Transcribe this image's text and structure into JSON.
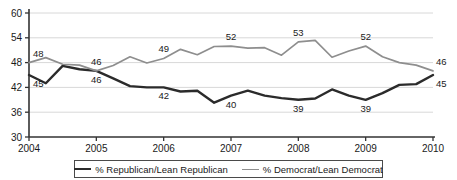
{
  "chart_data": {
    "type": "line",
    "title": "",
    "xlabel": "",
    "ylabel": "",
    "ylim": [
      30,
      60
    ],
    "xlim": [
      2004,
      2010
    ],
    "yticks": [
      30,
      36,
      42,
      48,
      54,
      60
    ],
    "xticks": [
      2004,
      2005,
      2006,
      2007,
      2008,
      2009,
      2010
    ],
    "ytick_labels": [
      "30",
      "36",
      "42",
      "48",
      "54",
      "60"
    ],
    "xtick_labels": [
      "2004",
      "2005",
      "2006",
      "2007",
      "2008",
      "2009",
      "2010"
    ],
    "grid": true,
    "legend_position": "bottom",
    "x": [
      2004.0,
      2004.25,
      2004.5,
      2004.75,
      2005.0,
      2005.25,
      2005.5,
      2005.75,
      2006.0,
      2006.25,
      2006.5,
      2006.75,
      2007.0,
      2007.25,
      2007.5,
      2007.75,
      2008.0,
      2008.25,
      2008.5,
      2008.75,
      2009.0,
      2009.25,
      2009.5,
      2009.75,
      2010.0
    ],
    "series": [
      {
        "name": "% Republican/Lean Republican",
        "color": "#2b2b2b",
        "values": [
          45.0,
          43.0,
          47.2,
          46.4,
          46.0,
          44.2,
          42.3,
          42.0,
          42.0,
          41.0,
          41.2,
          38.3,
          40.0,
          41.2,
          40.0,
          39.4,
          39.0,
          39.3,
          41.5,
          40.0,
          39.0,
          40.6,
          42.6,
          42.8,
          45.0
        ],
        "labels": [
          {
            "x": 2004.0,
            "value": 45,
            "text": "45"
          },
          {
            "x": 2005.0,
            "value": 46,
            "text": "46"
          },
          {
            "x": 2006.0,
            "value": 42,
            "text": "42"
          },
          {
            "x": 2007.0,
            "value": 40,
            "text": "40"
          },
          {
            "x": 2008.0,
            "value": 39,
            "text": "39"
          },
          {
            "x": 2009.0,
            "value": 39,
            "text": "39"
          },
          {
            "x": 2010.0,
            "value": 45,
            "text": "45"
          }
        ]
      },
      {
        "name": "% Democrat/Lean Democrat",
        "color": "#8e8e8e",
        "values": [
          48.0,
          49.2,
          47.6,
          47.4,
          46.0,
          47.3,
          49.4,
          47.9,
          49.0,
          51.2,
          49.9,
          51.9,
          52.0,
          51.5,
          51.6,
          49.8,
          53.0,
          53.4,
          49.3,
          50.8,
          52.0,
          49.4,
          48.0,
          47.4,
          46.0
        ],
        "labels": [
          {
            "x": 2004.0,
            "value": 48,
            "text": "48"
          },
          {
            "x": 2005.0,
            "value": 46,
            "text": "46"
          },
          {
            "x": 2006.0,
            "value": 49,
            "text": "49"
          },
          {
            "x": 2007.0,
            "value": 52,
            "text": "52"
          },
          {
            "x": 2008.0,
            "value": 53,
            "text": "53"
          },
          {
            "x": 2009.0,
            "value": 52,
            "text": "52"
          },
          {
            "x": 2010.0,
            "value": 46,
            "text": "46"
          }
        ]
      }
    ]
  },
  "legend": {
    "items": [
      {
        "label": "% Republican/Lean Republican",
        "color": "#2b2b2b"
      },
      {
        "label": "% Democrat/Lean Democrat",
        "color": "#8e8e8e"
      }
    ]
  },
  "colors": {
    "republican": "#2b2b2b",
    "democrat": "#8e8e8e",
    "axis": "#333333",
    "grid": "#d8d8d8",
    "background": "#ffffff"
  }
}
